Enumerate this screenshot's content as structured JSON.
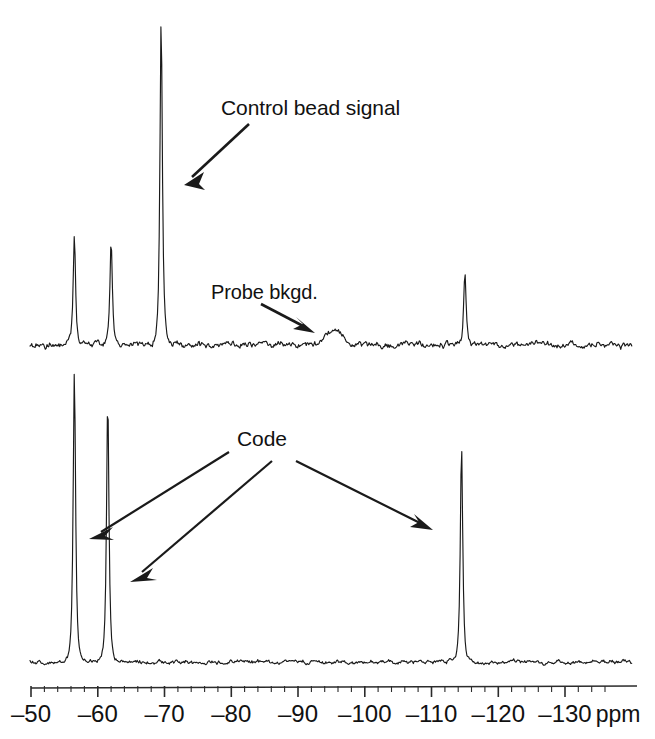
{
  "figure": {
    "type": "nmr-spectrum-figure",
    "panels": 2,
    "annotations": [
      {
        "name": "control-bead-signal",
        "text": "Control bead signal"
      },
      {
        "name": "probe-background",
        "text": "Probe bkgd."
      },
      {
        "name": "code",
        "text": "Code"
      }
    ]
  },
  "axis": {
    "unit_label": "ppm",
    "tick_labels": [
      "–50",
      "–60",
      "–70",
      "–80",
      "–90",
      "–100",
      "–110",
      "–120",
      "–130"
    ],
    "tick_values": [
      -50,
      -60,
      -70,
      -80,
      -90,
      -100,
      -110,
      -120,
      -130
    ],
    "minor_tick_step": 2,
    "range": [
      -48,
      -136
    ],
    "direction": "decreasing-left-to-right"
  },
  "chart_data": {
    "type": "line",
    "title": "",
    "subtitle": "",
    "xlabel": "ppm",
    "ylabel": "",
    "xlim": [
      -48,
      -136
    ],
    "grid": false,
    "legend": null,
    "series": [
      {
        "name": "Control bead spectrum (top trace)",
        "panel": "top",
        "peaks": [
          {
            "ppm": -56.5,
            "relative_height": 0.33,
            "label": "code peak 1"
          },
          {
            "ppm": -62.0,
            "relative_height": 0.32,
            "label": "code peak 2"
          },
          {
            "ppm": -69.5,
            "relative_height": 1.0,
            "label": "Control bead signal"
          },
          {
            "ppm": -95.5,
            "relative_height": 0.09,
            "label": "Probe bkgd."
          },
          {
            "ppm": -115.0,
            "relative_height": 0.22,
            "label": "code peak 3"
          }
        ],
        "baseline_noise": "low"
      },
      {
        "name": "Coded bead spectrum (bottom trace)",
        "panel": "bottom",
        "peaks": [
          {
            "ppm": -56.5,
            "relative_height": 1.0,
            "label": "Code"
          },
          {
            "ppm": -61.5,
            "relative_height": 0.91,
            "label": "Code"
          },
          {
            "ppm": -114.5,
            "relative_height": 0.75,
            "label": "Code"
          }
        ],
        "baseline_noise": "low"
      }
    ]
  },
  "labels": {
    "control_bead_signal": "Control bead signal",
    "probe_bkgd": "Probe bkgd.",
    "code": "Code",
    "ppm": "ppm",
    "tick_m50": "–50",
    "tick_m60": "–60",
    "tick_m70": "–70",
    "tick_m80": "–80",
    "tick_m90": "–90",
    "tick_m100": "–100",
    "tick_m110": "–110",
    "tick_m120": "–120",
    "tick_m130": "–130"
  },
  "colors": {
    "trace": "#1a1a1a",
    "text": "#111111",
    "background": "#ffffff",
    "arrow": "#1a1a1a"
  }
}
